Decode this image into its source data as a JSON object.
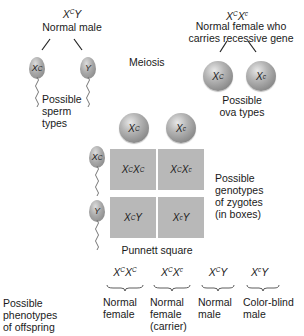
{
  "male_parent": {
    "genotype_base": "X",
    "genotype_sup": "C",
    "genotype_tail": "Y",
    "label": "Normal male"
  },
  "female_parent": {
    "g1_base": "X",
    "g1_sup": "C",
    "g2_base": "X",
    "g2_sup": "c",
    "label_line1": "Normal female who",
    "label_line2": "carries recessive gene"
  },
  "meiosis_label": "Meiosis",
  "sperm": [
    {
      "base": "X",
      "sup": "C",
      "tail": ""
    },
    {
      "base": "Y",
      "sup": "",
      "tail": ""
    }
  ],
  "sperm_label": {
    "line1": "Possible",
    "line2": "sperm",
    "line3": "types"
  },
  "ova": [
    {
      "base": "X",
      "sup": "C"
    },
    {
      "base": "X",
      "sup": "c"
    }
  ],
  "ova_label": {
    "line1": "Possible",
    "line2": "ova types"
  },
  "punnett": {
    "cells": [
      {
        "a": "X",
        "as": "C",
        "b": "X",
        "bs": "C"
      },
      {
        "a": "X",
        "as": "C",
        "b": "X",
        "bs": "c"
      },
      {
        "a": "X",
        "as": "C",
        "b": "Y",
        "bs": ""
      },
      {
        "a": "X",
        "as": "c",
        "b": "Y",
        "bs": ""
      }
    ],
    "caption": "Punnett square",
    "side_label": {
      "line1": "Possible",
      "line2": "genotypes",
      "line3": "of zygotes",
      "line4": "(in boxes)"
    },
    "cell_color": "#b8b8b8"
  },
  "phenotypes_label": {
    "line1": "Possible",
    "line2": "phenotypes",
    "line3": "of offspring"
  },
  "offspring": [
    {
      "a": "X",
      "as": "C",
      "b": "X",
      "bs": "C",
      "line1": "Normal",
      "line2": "female",
      "line3": ""
    },
    {
      "a": "X",
      "as": "C",
      "b": "X",
      "bs": "c",
      "line1": "Normal",
      "line2": "female",
      "line3": "(carrier)"
    },
    {
      "a": "X",
      "as": "C",
      "b": "Y",
      "bs": "",
      "line1": "Normal",
      "line2": "male",
      "line3": ""
    },
    {
      "a": "X",
      "as": "c",
      "b": "Y",
      "bs": "",
      "line1": "Color-blind",
      "line2": "male",
      "line3": ""
    }
  ]
}
